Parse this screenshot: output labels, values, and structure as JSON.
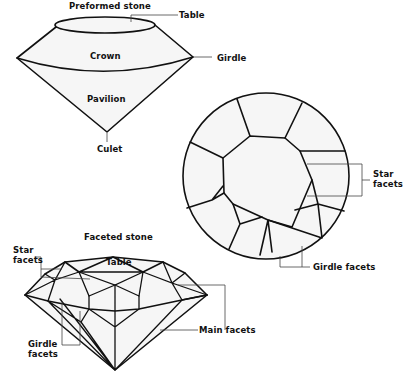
{
  "diagram": {
    "colors": {
      "background": "#ffffff",
      "stroke": "#111111",
      "fill": "#f6f6f6",
      "leader": "#444444"
    },
    "preformed_stone": {
      "title": "Preformed stone",
      "labels": {
        "table": "Table",
        "crown": "Crown",
        "girdle": "Girdle",
        "pavilion": "Pavilion",
        "culet": "Culet"
      }
    },
    "top_view": {
      "labels": {
        "star_facets_line1": "Star",
        "star_facets_line2": "facets",
        "girdle_facets": "Girdle facets"
      }
    },
    "faceted_stone": {
      "title": "Faceted stone",
      "labels": {
        "star_facets_line1": "Star",
        "star_facets_line2": "facets",
        "table": "Table",
        "main_facets": "Main facets",
        "girdle_facets_line1": "Girdle",
        "girdle_facets_line2": "facets"
      }
    }
  }
}
